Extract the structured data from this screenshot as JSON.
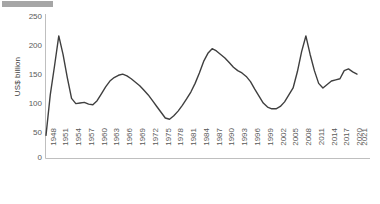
{
  "redaction": {
    "name": "redaction-bar",
    "color": "#a6a6a6"
  },
  "chart_data": {
    "type": "line",
    "title": "",
    "subtitle": "",
    "xlabel": "",
    "ylabel": "US$ billion",
    "ylim": [
      0,
      250
    ],
    "ytick_labels": [
      "250",
      "200",
      "150",
      "100",
      "50",
      "0"
    ],
    "ytick_values": [
      250,
      200,
      150,
      100,
      50,
      0
    ],
    "xtick_labels": [
      "1948",
      "1951",
      "1954",
      "1957",
      "1960",
      "1963",
      "1966",
      "1969",
      "1972",
      "1975",
      "1978",
      "1981",
      "1984",
      "1987",
      "1990",
      "1993",
      "1996",
      "1999",
      "2002",
      "2005",
      "2008",
      "2011",
      "2014",
      "2017",
      "2020",
      "2021"
    ],
    "grid": false,
    "legend": null,
    "line_color": "#3f3f3f",
    "line_width": 1.4,
    "x": [
      1948,
      1949,
      1950,
      1951,
      1952,
      1953,
      1954,
      1955,
      1956,
      1957,
      1958,
      1959,
      1960,
      1961,
      1962,
      1963,
      1964,
      1965,
      1966,
      1967,
      1968,
      1969,
      1970,
      1971,
      1972,
      1973,
      1974,
      1975,
      1976,
      1977,
      1978,
      1979,
      1980,
      1981,
      1982,
      1983,
      1984,
      1985,
      1986,
      1987,
      1988,
      1989,
      1990,
      1991,
      1992,
      1993,
      1994,
      1995,
      1996,
      1997,
      1998,
      1999,
      2000,
      2001,
      2002,
      2003,
      2004,
      2005,
      2006,
      2007,
      2008,
      2009,
      2010,
      2011,
      2012,
      2013,
      2014,
      2015,
      2016,
      2017,
      2018,
      2019,
      2020,
      2021
    ],
    "values": [
      40,
      110,
      160,
      212,
      180,
      140,
      104,
      95,
      96,
      97,
      94,
      93,
      100,
      112,
      124,
      134,
      140,
      144,
      146,
      143,
      138,
      132,
      126,
      118,
      110,
      100,
      90,
      80,
      70,
      68,
      74,
      82,
      92,
      103,
      115,
      130,
      148,
      168,
      182,
      190,
      186,
      180,
      174,
      166,
      158,
      152,
      148,
      142,
      133,
      120,
      108,
      96,
      89,
      86,
      86,
      90,
      98,
      110,
      122,
      150,
      185,
      212,
      180,
      152,
      130,
      122,
      128,
      134,
      136,
      138,
      152,
      155,
      150,
      146
    ]
  }
}
